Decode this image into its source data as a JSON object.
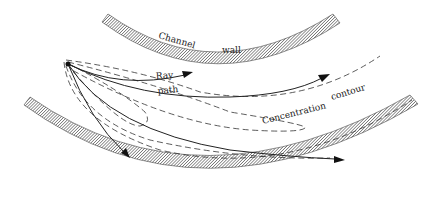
{
  "diagram": {
    "type": "plume dispersion in curved channel",
    "labels": {
      "channel": "Channel",
      "wall": "wall",
      "ray": "Ray",
      "path": "path",
      "concentration": "Concentration",
      "contour": "contour"
    },
    "elements": {
      "top_wall": "hatched outer channel wall (upper)",
      "bottom_wall": "hatched channel wall (lower)",
      "source": "point source",
      "ray_paths": 4,
      "concentration_contours": 5
    },
    "colors": {
      "line": "#222222",
      "hatch": "#555555",
      "background": "#ffffff"
    }
  }
}
